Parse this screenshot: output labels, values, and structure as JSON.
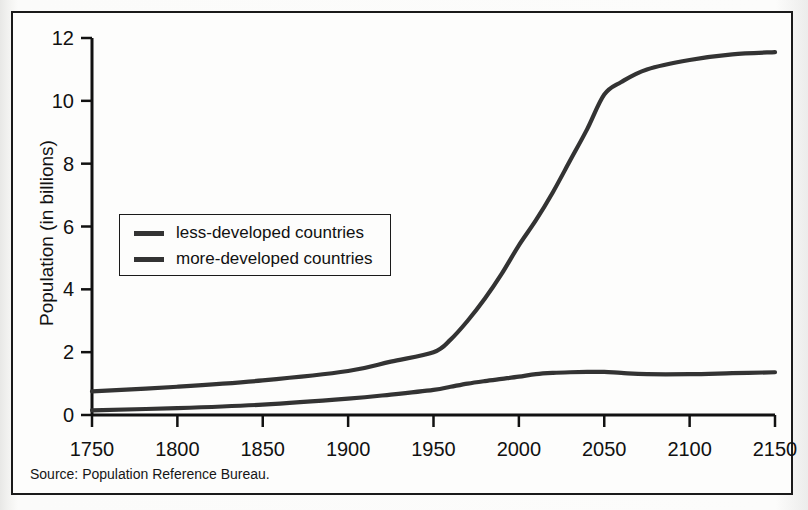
{
  "figure": {
    "source_note": "Source: Population Reference Bureau.",
    "frame_color": "#1a1a1a",
    "background_color": "#fdfdfc",
    "line_color": "#333333"
  },
  "chart_data": {
    "type": "line",
    "title": "",
    "xlabel": "",
    "ylabel": "Population (in billions)",
    "xlim": [
      1750,
      2150
    ],
    "ylim": [
      0,
      12
    ],
    "xticks": [
      1750,
      1800,
      1850,
      1900,
      1950,
      2000,
      2050,
      2100,
      2150
    ],
    "xtick_labels": [
      "1750",
      "1800",
      "1850",
      "1900",
      "1950",
      "2000",
      "2050",
      "2100",
      "2150"
    ],
    "yticks": [
      0,
      2,
      4,
      6,
      8,
      10,
      12
    ],
    "ytick_labels": [
      "0",
      "2",
      "4",
      "6",
      "8",
      "10",
      "12"
    ],
    "grid": false,
    "legend_position": "center-left",
    "x": [
      1750,
      1800,
      1850,
      1900,
      1925,
      1950,
      1960,
      1970,
      1980,
      1990,
      2000,
      2010,
      2020,
      2030,
      2040,
      2050,
      2060,
      2075,
      2100,
      2125,
      2150
    ],
    "series": [
      {
        "name": "less-developed countries",
        "values": [
          0.75,
          0.9,
          1.1,
          1.4,
          1.7,
          2.0,
          2.4,
          3.0,
          3.7,
          4.5,
          5.4,
          6.2,
          7.1,
          8.1,
          9.1,
          10.2,
          10.6,
          11.0,
          11.3,
          11.48,
          11.55
        ],
        "color": "#333333"
      },
      {
        "name": "more-developed countries",
        "values": [
          0.15,
          0.22,
          0.33,
          0.52,
          0.65,
          0.8,
          0.9,
          1.0,
          1.08,
          1.15,
          1.22,
          1.3,
          1.34,
          1.36,
          1.37,
          1.37,
          1.34,
          1.3,
          1.3,
          1.33,
          1.36
        ],
        "color": "#333333"
      }
    ]
  },
  "legend": {
    "items": [
      {
        "label": "less-developed countries"
      },
      {
        "label": "more-developed countries"
      }
    ]
  }
}
